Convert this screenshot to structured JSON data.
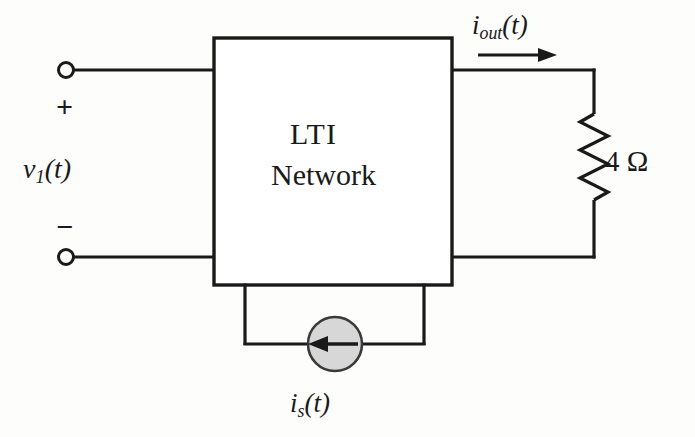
{
  "diagram": {
    "block": {
      "line1": "LTI",
      "line2": "Network"
    },
    "input_port": {
      "signal_label": "v",
      "signal_sub": "1",
      "signal_arg": "(t)",
      "plus": "+",
      "minus": "−",
      "terminal_top_name": "input-terminal-positive",
      "terminal_bottom_name": "input-terminal-negative"
    },
    "output_current": {
      "symbol": "i",
      "subscript": "out",
      "arg": "(t)",
      "direction": "right"
    },
    "resistor": {
      "value": "4",
      "unit": "Ω",
      "label": "4 Ω"
    },
    "source": {
      "symbol": "i",
      "subscript": "s",
      "arg": "(t)",
      "type": "independent-current-source",
      "arrow_direction": "left",
      "fill_color": "#d7d7d7"
    },
    "colors": {
      "wire": "#1a1a1a",
      "background": "#fdfdfc",
      "source_fill": "#d7d7d7",
      "source_stroke": "#3a3a3a"
    }
  }
}
